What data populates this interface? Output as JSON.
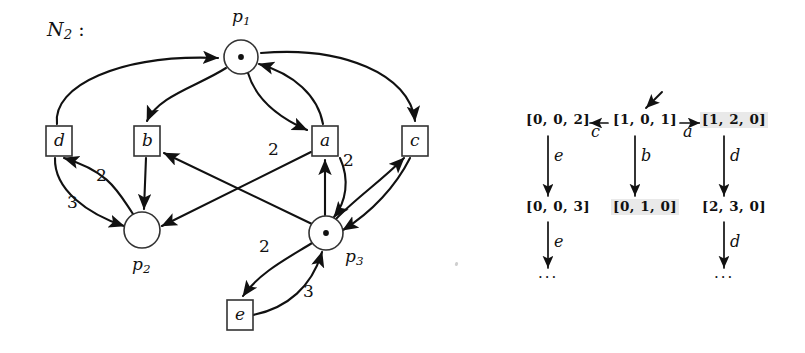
{
  "figure": {
    "net_title": "N",
    "net_title_sub": "2",
    "net_title_colon": " :"
  },
  "petri_net": {
    "places": [
      {
        "id": "p1",
        "name": "p",
        "sub": "1",
        "tokens": 1,
        "cx": 241,
        "cy": 57,
        "r": 17,
        "label_x": 232,
        "label_y": 8
      },
      {
        "id": "p2",
        "name": "p",
        "sub": "2",
        "tokens": 0,
        "cx": 142,
        "cy": 230,
        "r": 18,
        "label_x": 132,
        "label_y": 258
      },
      {
        "id": "p3",
        "name": "p",
        "sub": "3",
        "tokens": 1,
        "cx": 326,
        "cy": 233,
        "r": 17,
        "label_x": 345,
        "label_y": 250
      }
    ],
    "transitions": [
      {
        "id": "d",
        "label": "d",
        "x": 46,
        "y": 126,
        "w": 26,
        "h": 30
      },
      {
        "id": "b",
        "label": "b",
        "x": 134,
        "y": 126,
        "w": 26,
        "h": 30
      },
      {
        "id": "a",
        "label": "a",
        "x": 312,
        "y": 126,
        "w": 26,
        "h": 30
      },
      {
        "id": "c",
        "label": "c",
        "x": 402,
        "y": 126,
        "w": 26,
        "h": 30
      },
      {
        "id": "e",
        "label": "e",
        "x": 227,
        "y": 300,
        "w": 26,
        "h": 30
      }
    ],
    "arcs": [
      {
        "from": "d",
        "to": "p1",
        "weight": ""
      },
      {
        "from": "p1",
        "to": "b",
        "weight": ""
      },
      {
        "from": "p1",
        "to": "a",
        "weight": ""
      },
      {
        "from": "a",
        "to": "p1",
        "weight": ""
      },
      {
        "from": "p1",
        "to": "c",
        "weight": ""
      },
      {
        "from": "d",
        "to": "p2",
        "weight": "3"
      },
      {
        "from": "p2",
        "to": "d",
        "weight": "2"
      },
      {
        "from": "b",
        "to": "p2",
        "weight": ""
      },
      {
        "from": "a",
        "to": "p2",
        "weight": "2"
      },
      {
        "from": "p3",
        "to": "b",
        "weight": "2"
      },
      {
        "from": "p3",
        "to": "a",
        "weight": ""
      },
      {
        "from": "a",
        "to": "p3",
        "weight": "2"
      },
      {
        "from": "p3",
        "to": "c",
        "weight": ""
      },
      {
        "from": "c",
        "to": "p3",
        "weight": ""
      },
      {
        "from": "p3",
        "to": "e",
        "weight": "2"
      },
      {
        "from": "e",
        "to": "p3",
        "weight": "3"
      }
    ],
    "weight_labels": [
      {
        "text": "2",
        "x": 96,
        "y": 174
      },
      {
        "text": "3",
        "x": 67,
        "y": 201
      },
      {
        "text": "2",
        "x": 268,
        "y": 148
      },
      {
        "text": "2",
        "x": 343,
        "y": 159
      },
      {
        "text": "2",
        "x": 259,
        "y": 245
      },
      {
        "text": "3",
        "x": 303,
        "y": 290
      }
    ]
  },
  "tree": {
    "root_incoming_arrow": "incoming-arrow",
    "nodes": [
      {
        "id": "n-root",
        "text": "[1, 0, 1]",
        "x": 617,
        "y": 118,
        "highlight": false
      },
      {
        "id": "n-left",
        "text": "[0, 0, 2]",
        "x": 530,
        "y": 118,
        "highlight": false
      },
      {
        "id": "n-right",
        "text": "[1, 2, 0]",
        "x": 706,
        "y": 118,
        "highlight": true
      },
      {
        "id": "n-left2",
        "text": "[0, 0, 3]",
        "x": 530,
        "y": 205,
        "highlight": false
      },
      {
        "id": "n-mid2",
        "text": "[0, 1, 0]",
        "x": 617,
        "y": 205,
        "highlight": true
      },
      {
        "id": "n-right2",
        "text": "[2, 3, 0]",
        "x": 706,
        "y": 205,
        "highlight": false
      }
    ],
    "edge_labels": [
      {
        "id": "edge-c",
        "text": "c",
        "x": 592,
        "y": 129
      },
      {
        "id": "edge-a",
        "text": "a",
        "x": 688,
        "y": 129
      },
      {
        "id": "edge-e1",
        "text": "e",
        "x": 556,
        "y": 155
      },
      {
        "id": "edge-b",
        "text": "b",
        "x": 643,
        "y": 155
      },
      {
        "id": "edge-d1",
        "text": "d",
        "x": 733,
        "y": 155
      },
      {
        "id": "edge-e2",
        "text": "e",
        "x": 556,
        "y": 240
      },
      {
        "id": "edge-d2",
        "text": "d",
        "x": 733,
        "y": 240
      }
    ],
    "ellipses": [
      {
        "id": "ellipsis-left",
        "text": "...",
        "x": 540,
        "y": 272
      },
      {
        "id": "ellipsis-right",
        "text": "...",
        "x": 716,
        "y": 272
      }
    ]
  }
}
